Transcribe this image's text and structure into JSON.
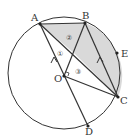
{
  "figure": {
    "points": {
      "A": {
        "label": "A",
        "x": 40,
        "y": 24
      },
      "B": {
        "label": "B",
        "x": 85,
        "y": 23
      },
      "C": {
        "label": "C",
        "x": 118,
        "y": 97
      },
      "D": {
        "label": "D",
        "x": 88,
        "y": 126
      },
      "E": {
        "label": "E",
        "x": 117,
        "y": 53
      },
      "O": {
        "label": "O",
        "x": 64,
        "y": 76
      }
    },
    "regions": {
      "r1": "①",
      "r2": "②",
      "r3": "③"
    },
    "colors": {
      "stroke": "#333333",
      "shade": "#d9d9d9"
    }
  }
}
